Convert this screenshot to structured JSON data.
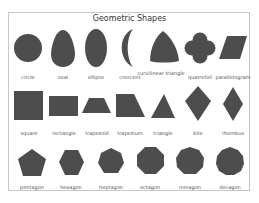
{
  "title": "Geometric Shapes",
  "fill_color": "#4d4d4d",
  "rows": [
    {
      "shapes": [
        {
          "name": "circle",
          "label": "circle"
        },
        {
          "name": "oval",
          "label": "oval"
        },
        {
          "name": "ellipse",
          "label": "ellipse"
        },
        {
          "name": "crescent",
          "label": "crescent"
        },
        {
          "name": "curvilinear-triangle",
          "label": "curvilinear triangle"
        },
        {
          "name": "quatrefoil",
          "label": "quatrefoil"
        },
        {
          "name": "parallelogram",
          "label": "parallelogram"
        }
      ]
    },
    {
      "shapes": [
        {
          "name": "square",
          "label": "square"
        },
        {
          "name": "rectangle",
          "label": "rectangle"
        },
        {
          "name": "trapezoid",
          "label": "trapezoid"
        },
        {
          "name": "trapezium",
          "label": "trapezium"
        },
        {
          "name": "triangle",
          "label": "triangle"
        },
        {
          "name": "kite",
          "label": "kite"
        },
        {
          "name": "rhombus",
          "label": "rhombus"
        }
      ]
    },
    {
      "shapes": [
        {
          "name": "pentagon",
          "label": "pentagon"
        },
        {
          "name": "hexagon",
          "label": "hexagon"
        },
        {
          "name": "heptagon",
          "label": "heptagon"
        },
        {
          "name": "octagon",
          "label": "octagon"
        },
        {
          "name": "nonagon",
          "label": "nonagon"
        },
        {
          "name": "decagon",
          "label": "decagon"
        }
      ]
    }
  ]
}
